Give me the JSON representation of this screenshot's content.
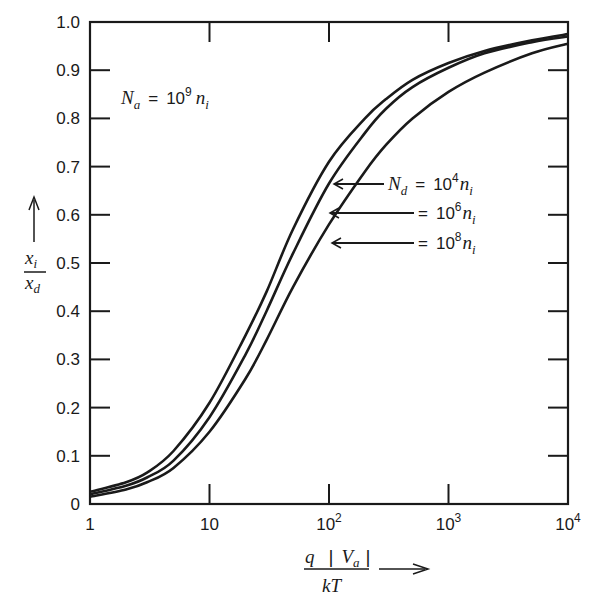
{
  "chart_data": {
    "type": "line",
    "title": "",
    "xscale": "log",
    "xlim": [
      1,
      10000
    ],
    "ylim": [
      0,
      1.0
    ],
    "grid": false,
    "xlabel": "q |Va| / kT",
    "ylabel": "xi / xd",
    "x_ticks": [
      1,
      10,
      100,
      1000,
      10000
    ],
    "x_tick_labels": [
      "1",
      "10",
      "10^2",
      "10^3",
      "10^4"
    ],
    "y_ticks": [
      0,
      0.1,
      0.2,
      0.3,
      0.4,
      0.5,
      0.6,
      0.7,
      0.8,
      0.9,
      1.0
    ],
    "y_tick_labels": [
      "0",
      "0.1",
      "0.2",
      "0.3",
      "0.4",
      "0.5",
      "0.6",
      "0.7",
      "0.8",
      "0.9",
      "1.0"
    ],
    "annotations": [
      {
        "text": "Na = 10^9 ni",
        "position": "upper-left"
      },
      {
        "text": "Nd = 10^4 ni",
        "points_to": "series 0"
      },
      {
        "text": "= 10^6 ni",
        "points_to": "series 1"
      },
      {
        "text": "= 10^8 ni",
        "points_to": "series 2"
      }
    ],
    "x": [
      1,
      2,
      3,
      5,
      10,
      20,
      30,
      50,
      100,
      200,
      300,
      500,
      1000,
      2000,
      5000,
      10000
    ],
    "series": [
      {
        "name": "Nd = 10^4 ni",
        "values": [
          0.025,
          0.045,
          0.065,
          0.11,
          0.21,
          0.35,
          0.44,
          0.57,
          0.71,
          0.8,
          0.84,
          0.88,
          0.915,
          0.94,
          0.962,
          0.975
        ]
      },
      {
        "name": "Nd = 10^6 ni",
        "values": [
          0.02,
          0.038,
          0.055,
          0.09,
          0.18,
          0.31,
          0.4,
          0.52,
          0.665,
          0.77,
          0.82,
          0.865,
          0.905,
          0.935,
          0.958,
          0.97
        ]
      },
      {
        "name": "Nd = 10^8 ni",
        "values": [
          0.015,
          0.03,
          0.045,
          0.075,
          0.15,
          0.26,
          0.34,
          0.45,
          0.58,
          0.69,
          0.745,
          0.8,
          0.855,
          0.895,
          0.935,
          0.955
        ]
      }
    ]
  },
  "labels": {
    "na_prefix": "N",
    "na_sub": "a",
    "na_eq": "=",
    "na_base": "10",
    "na_exp": "9",
    "n": "n",
    "n_sub": "i",
    "nd_prefix": "N",
    "nd_sub": "d",
    "eq": "=",
    "base": "10",
    "exp4": "4",
    "exp6": "6",
    "exp8": "8",
    "ylabel_num": "x",
    "ylabel_num_sub": "i",
    "ylabel_den": "x",
    "ylabel_den_sub": "d",
    "xlabel_q": "q",
    "xlabel_bar": "|",
    "xlabel_V": "V",
    "xlabel_V_sub": "a",
    "xlabel_kT": "kT"
  }
}
